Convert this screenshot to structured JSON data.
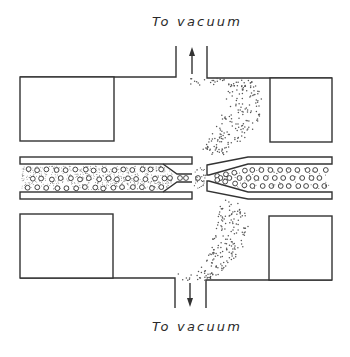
{
  "diagram": {
    "labels": {
      "top_port": "To vacuum",
      "bottom_port": "To vacuum"
    },
    "components": [
      {
        "id": "upper-left-block",
        "type": "block"
      },
      {
        "id": "upper-right-block",
        "type": "block"
      },
      {
        "id": "lower-left-block",
        "type": "block"
      },
      {
        "id": "lower-right-block",
        "type": "block"
      },
      {
        "id": "left-capillary-nozzle",
        "type": "tapered tube",
        "contents": "gas with dispersed particles"
      },
      {
        "id": "right-skimmer-tube",
        "type": "tapered tube",
        "contents": "particles"
      },
      {
        "id": "top-vacuum-port",
        "type": "pumping port",
        "arrow": "up"
      },
      {
        "id": "bottom-vacuum-port",
        "type": "pumping port",
        "arrow": "down"
      },
      {
        "id": "gas-plume",
        "type": "dotted expansion plume"
      }
    ],
    "colors": {
      "line": "#333333",
      "background": "#ffffff"
    }
  }
}
